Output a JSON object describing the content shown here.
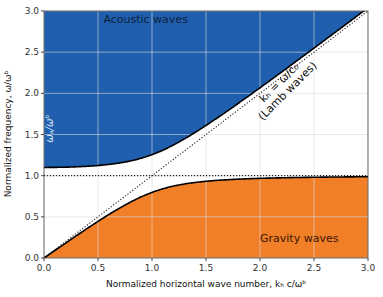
{
  "chart_data": {
    "type": "area",
    "title": "",
    "xlabel": "Normalized horizontal wave number, kₕ c/ωᵇ",
    "ylabel": "Normalized frequency, ω/ωᵇ",
    "xlim": [
      0.0,
      3.0
    ],
    "ylim": [
      0.0,
      3.0
    ],
    "xticks": [
      "0.0",
      "0.5",
      "1.0",
      "1.5",
      "2.0",
      "2.5",
      "3.0"
    ],
    "yticks": [
      "0.0",
      "0.5",
      "1.0",
      "1.5",
      "2.0",
      "2.5",
      "3.0"
    ],
    "grid": true,
    "parameters": {
      "omega_a_over_omega_b": 1.1,
      "N_over_omega_b": 1.0
    },
    "series": [
      {
        "name": "Acoustic waves (upper branch)",
        "color": "#1f5fae",
        "fill": "above",
        "x": [
          0.0,
          0.5,
          1.0,
          1.5,
          2.0,
          2.5,
          3.0
        ],
        "y": [
          1.1,
          1.16,
          1.33,
          1.66,
          2.09,
          2.55,
          3.02
        ]
      },
      {
        "name": "Gravity waves (lower branch)",
        "color": "#f07f27",
        "fill": "below",
        "x": [
          0.0,
          0.5,
          1.0,
          1.5,
          2.0,
          2.5,
          3.0
        ],
        "y": [
          0.0,
          0.43,
          0.75,
          0.9,
          0.96,
          0.98,
          0.99
        ]
      },
      {
        "name": "Lamb waves kₕ = ω/c₀",
        "style": "dotted",
        "x": [
          0.0,
          3.0
        ],
        "y": [
          0.0,
          3.0
        ]
      },
      {
        "name": "Buoyancy frequency",
        "style": "dotted",
        "x": [
          0.0,
          3.0
        ],
        "y": [
          1.0,
          1.0
        ]
      }
    ],
    "annotations": [
      {
        "text": "Acoustic waves",
        "x": 0.55,
        "y": 2.85
      },
      {
        "text": "Gravity waves",
        "x": 2.0,
        "y": 0.2
      },
      {
        "text": "ωₐ/ωᵇ",
        "x": 0.08,
        "y": 1.4,
        "rotation": 90
      },
      {
        "text": "kₕ = ω/c₀",
        "line2": "(Lamb waves)",
        "x": 2.2,
        "y": 2.1,
        "rotation": -45
      }
    ]
  }
}
